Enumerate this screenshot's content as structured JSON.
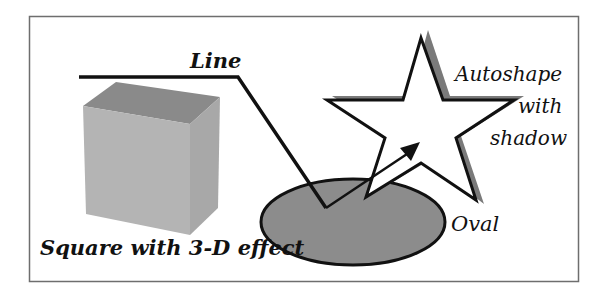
{
  "diagram": {
    "labels": {
      "line": "Line",
      "autoshape_line1": "Autoshape",
      "autoshape_line2": "with",
      "autoshape_line3": "shadow",
      "oval": "Oval",
      "square": "Square with 3-D effect"
    },
    "colors": {
      "frame": "#6e6e6e",
      "stroke": "#111111",
      "oval_fill": "#8c8c8c",
      "star_shadow": "#7a7a7a",
      "cube_top": "#8a8a8a",
      "cube_front": "#b4b4b4",
      "cube_side": "#a8a8a8"
    },
    "shapes": [
      "line",
      "square-3d",
      "oval",
      "star-autoshape",
      "arrow"
    ]
  }
}
